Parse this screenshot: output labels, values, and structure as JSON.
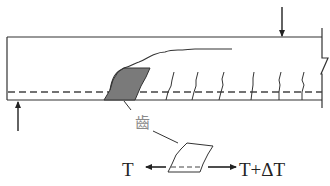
{
  "diagram": {
    "type": "beam-crack-tooth-mechanism",
    "beam": {
      "description": "Reinforced concrete beam with flexural cracks, dashed reinforcement line, and a broken right end",
      "stroke_color": "#333333",
      "tooth_fill": "#7a7a7a"
    },
    "loads": {
      "top_arrow": "downward load",
      "bottom_arrow": "upward support reaction"
    },
    "labels": {
      "tooth": "齒",
      "left_force": "T",
      "right_force": "T+ΔT"
    },
    "flexural_crack_count": 7
  }
}
